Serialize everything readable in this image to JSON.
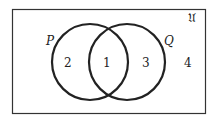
{
  "diagram": {
    "type": "venn",
    "universe_label": "𝔘",
    "sets": [
      {
        "name": "P",
        "label": "P"
      },
      {
        "name": "Q",
        "label": "Q"
      }
    ],
    "regions": [
      {
        "id": "only_P",
        "label": "2"
      },
      {
        "id": "P_and_Q",
        "label": "1"
      },
      {
        "id": "only_Q",
        "label": "3"
      },
      {
        "id": "outside",
        "label": "4"
      }
    ],
    "colors": {
      "stroke": "#222222",
      "background": "#ffffff"
    }
  }
}
